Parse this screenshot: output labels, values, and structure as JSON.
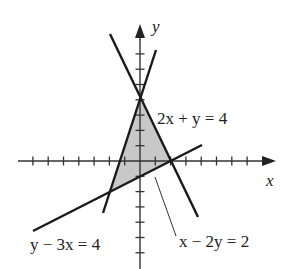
{
  "diagram": {
    "axes": {
      "x_label": "x",
      "y_label": "y",
      "origin_px": [
        140,
        161
      ],
      "unit_px": 15.3,
      "x_ticks": [
        -7,
        -6,
        -5,
        -4,
        -3,
        -2,
        -1,
        1,
        2,
        3,
        4,
        5,
        6,
        7
      ],
      "y_ticks": [
        -6,
        -5,
        -4,
        -3,
        -2,
        -1,
        1,
        2,
        3,
        4,
        5,
        6,
        7
      ]
    },
    "lines": [
      {
        "id": "line-2x-plus-y",
        "label": "2x + y = 4"
      },
      {
        "id": "line-x-minus-2y",
        "label": "x − 2y = 2"
      },
      {
        "id": "line-y-minus-3x",
        "label": "y − 3x = 4"
      }
    ],
    "region": {
      "vertices": [
        [
          0,
          4
        ],
        [
          2,
          0
        ],
        [
          -2,
          -2
        ]
      ],
      "fill": "#c8c8c8"
    },
    "colors": {
      "line": "#1a1a1a",
      "axis": "#333333",
      "shade": "#c8c8c8"
    }
  }
}
